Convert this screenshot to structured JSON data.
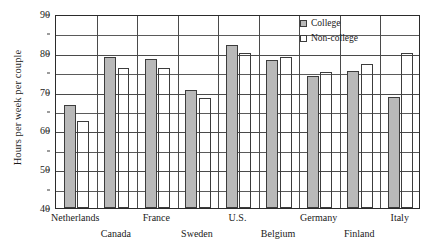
{
  "chart_data": {
    "type": "bar",
    "title": "",
    "xlabel": "",
    "ylabel": "Hours per week per couple",
    "ylim": [
      40,
      90
    ],
    "ytick_labels": [
      "40",
      "50",
      "60",
      "70",
      "80",
      "90"
    ],
    "ytick_values": [
      40,
      50,
      60,
      70,
      80,
      90
    ],
    "minor_gridline_values": [
      45,
      55,
      65,
      75,
      85
    ],
    "grid": true,
    "legend_position": "top-right",
    "categories": [
      "Netherlands",
      "Canada",
      "France",
      "Sweden",
      "U.S.",
      "Belgium",
      "Germany",
      "Finland",
      "Italy"
    ],
    "series": [
      {
        "name": "College",
        "color": "#b9b9b9",
        "values": [
          66.5,
          79.0,
          78.3,
          70.3,
          82.0,
          78.2,
          74.0,
          75.3,
          68.7
        ]
      },
      {
        "name": "Non-college",
        "color": "#ffffff",
        "values": [
          62.5,
          76.0,
          76.0,
          68.3,
          80.0,
          78.8,
          75.0,
          77.0,
          80.0
        ]
      }
    ]
  },
  "legend": {
    "items": [
      {
        "label": "College"
      },
      {
        "label": "Non-college"
      }
    ]
  },
  "colors": {
    "college_fill": "#b9b9b9",
    "noncollege_fill": "#ffffff",
    "axis": "#2b2b2b",
    "gridline": "#4a4a4a"
  }
}
